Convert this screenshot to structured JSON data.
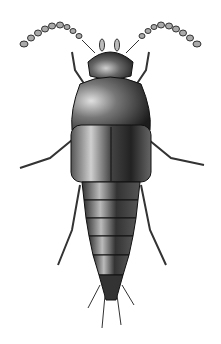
{
  "image": {
    "subject": "rove beetle illustration",
    "view": "dorsal",
    "style": "black-and-white stipple drawing",
    "background": "#ffffff",
    "colors": {
      "dark": "#1a1a1a",
      "mid": "#555555",
      "light": "#9a9a9a",
      "highlight": "#d8d8d8"
    }
  }
}
